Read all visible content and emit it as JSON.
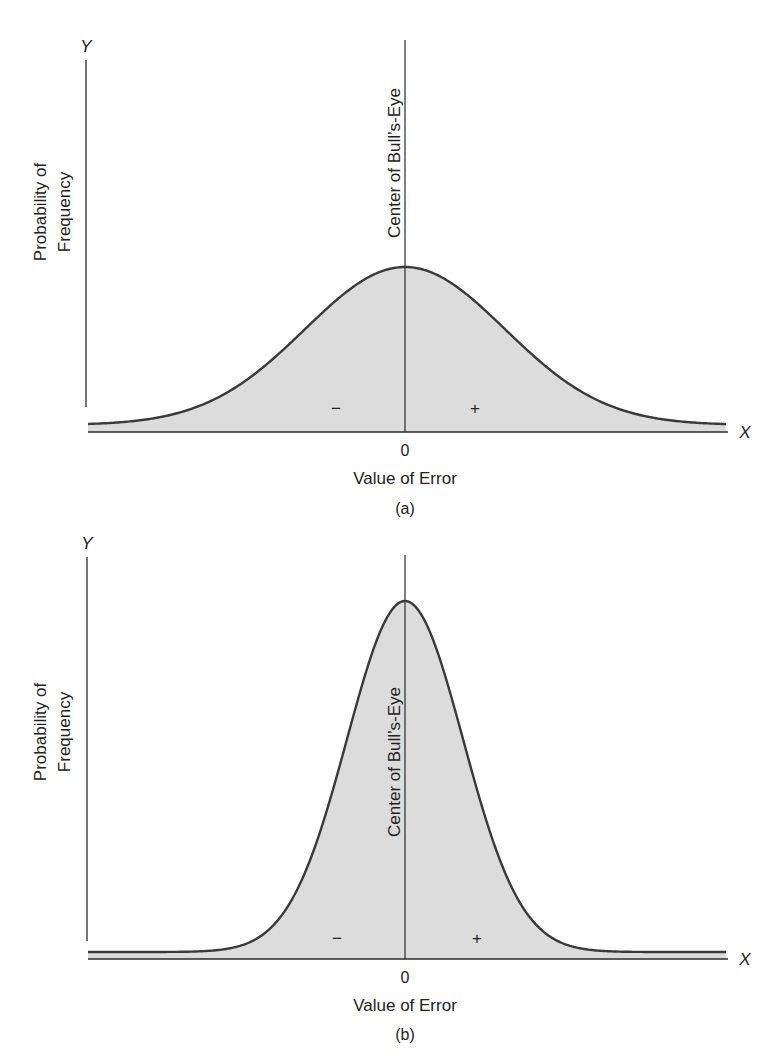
{
  "figure": {
    "panels": [
      {
        "id": "a",
        "caption": "(a)",
        "y_axis_letter": "Y",
        "x_axis_letter": "X",
        "y_label_line1": "Probability of",
        "y_label_line2": "Frequency",
        "center_label": "Center of Bull’s-Eye",
        "x_label": "Value of Error",
        "zero_tick": "0",
        "minus_sign": "−",
        "plus_sign": "+"
      },
      {
        "id": "b",
        "caption": "(b)",
        "y_axis_letter": "Y",
        "x_axis_letter": "X",
        "y_label_line1": "Probability of",
        "y_label_line2": "Frequency",
        "center_label": "Center of Bull’s-Eye",
        "x_label": "Value of Error",
        "zero_tick": "0",
        "minus_sign": "−",
        "plus_sign": "+"
      }
    ],
    "colors": {
      "curve": "#3a3a3a",
      "fill": "#dcdcdc",
      "axis": "#2a2a2a"
    }
  },
  "chart_data": [
    {
      "type": "area",
      "title": "(a)",
      "xlabel": "Value of Error",
      "ylabel": "Probability of Frequency",
      "x_ticks": [
        "0"
      ],
      "annotations": [
        "Center of Bull’s-Eye",
        "−",
        "+"
      ],
      "distribution": "normal",
      "relative_spread": "wide",
      "sigma_relative": 1.0,
      "peak_height_relative": 0.45,
      "grid": false
    },
    {
      "type": "area",
      "title": "(b)",
      "xlabel": "Value of Error",
      "ylabel": "Probability of Frequency",
      "x_ticks": [
        "0"
      ],
      "annotations": [
        "Center of Bull’s-Eye",
        "−",
        "+"
      ],
      "distribution": "normal",
      "relative_spread": "narrow",
      "sigma_relative": 0.6,
      "peak_height_relative": 1.0,
      "grid": false
    }
  ]
}
